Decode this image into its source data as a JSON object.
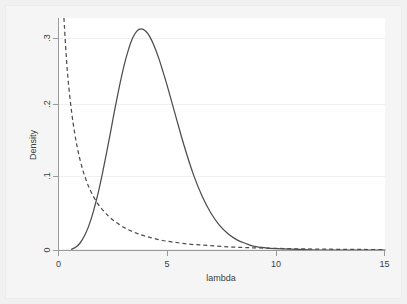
{
  "chart_data": {
    "type": "line",
    "title": "",
    "subtitle": "",
    "xlabel": "lambda",
    "ylabel": "Density",
    "xlim": [
      0,
      15
    ],
    "ylim": [
      0,
      0.32
    ],
    "xticks": [
      0,
      5,
      10,
      15
    ],
    "xticklabels": [
      "0",
      "5",
      "10",
      "15"
    ],
    "yticks": [
      0,
      0.1,
      0.2,
      0.3
    ],
    "yticklabels": [
      "0",
      ".1",
      ".2",
      ".3"
    ],
    "grid": "horizontal-faint",
    "legend": "none",
    "background": "#ffffff",
    "series": [
      {
        "name": "solid-density",
        "style": "solid",
        "color": "#4d4d4d",
        "x": [
          0.6,
          0.8,
          1.0,
          1.2,
          1.4,
          1.6,
          1.8,
          2.0,
          2.2,
          2.4,
          2.6,
          2.8,
          3.0,
          3.2,
          3.4,
          3.6,
          3.8,
          4.0,
          4.2,
          4.4,
          4.6,
          4.8,
          5.0,
          5.4,
          5.8,
          6.2,
          6.6,
          7.0,
          7.4,
          7.8,
          8.2,
          8.6,
          9.0,
          9.5,
          10.0,
          11.0,
          12.0,
          13.0,
          14.0,
          15.0
        ],
        "y": [
          0.001,
          0.004,
          0.01,
          0.02,
          0.034,
          0.053,
          0.076,
          0.103,
          0.133,
          0.164,
          0.196,
          0.226,
          0.253,
          0.275,
          0.292,
          0.302,
          0.305,
          0.302,
          0.294,
          0.281,
          0.265,
          0.246,
          0.226,
          0.183,
          0.141,
          0.104,
          0.074,
          0.051,
          0.034,
          0.022,
          0.014,
          0.009,
          0.005,
          0.003,
          0.002,
          0.001,
          0.0,
          0.0,
          0.0,
          0.0
        ]
      },
      {
        "name": "dashed-density",
        "style": "dashed",
        "color": "#4d4d4d",
        "x": [
          0.25,
          0.35,
          0.45,
          0.6,
          0.75,
          0.9,
          1.1,
          1.3,
          1.5,
          1.8,
          2.1,
          2.4,
          2.8,
          3.2,
          3.6,
          4.0,
          4.5,
          5.0,
          5.5,
          6.0,
          6.5,
          7.0,
          7.5,
          8.0,
          8.5,
          9.0,
          10.0,
          11.0,
          12.0,
          13.0,
          14.0,
          15.0
        ],
        "y": [
          0.32,
          0.27,
          0.232,
          0.191,
          0.16,
          0.136,
          0.112,
          0.094,
          0.08,
          0.064,
          0.053,
          0.044,
          0.035,
          0.028,
          0.023,
          0.019,
          0.015,
          0.012,
          0.01,
          0.008,
          0.007,
          0.006,
          0.005,
          0.004,
          0.0035,
          0.003,
          0.0022,
          0.0016,
          0.0012,
          0.0009,
          0.0007,
          0.0005
        ]
      }
    ]
  },
  "axis": {
    "x_title": "lambda",
    "y_title": "Density",
    "x_tick_0": "0",
    "x_tick_1": "5",
    "x_tick_2": "10",
    "x_tick_3": "15",
    "y_tick_0": "0",
    "y_tick_1": ".1",
    "y_tick_2": ".2",
    "y_tick_3": ".3"
  }
}
